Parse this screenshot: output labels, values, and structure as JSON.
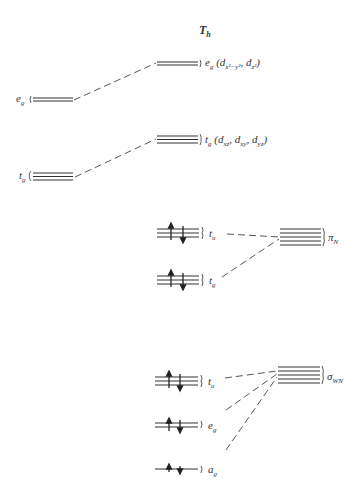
{
  "title": {
    "main": "T",
    "sub": "h"
  },
  "left_levels": [
    {
      "symbol": "e",
      "sub": "g",
      "lines": 2
    },
    {
      "symbol": "t",
      "sub": "g",
      "lines": 3
    }
  ],
  "right_d_levels": [
    {
      "symbol": "e",
      "sub": "g",
      "orbitals": "(d",
      "o1": "x²−y²",
      "o2": "z²",
      "lines": 2
    },
    {
      "symbol": "t",
      "sub": "g",
      "orbitals": "(d",
      "o1": "xz",
      "o2": "xy",
      "o3": "yz",
      "lines": 3
    }
  ],
  "ligand_levels": [
    {
      "symbol": "t",
      "sub": "u",
      "lines": 3,
      "electrons": 6
    },
    {
      "symbol": "t",
      "sub": "g",
      "lines": 3,
      "electrons": 6
    },
    {
      "symbol": "t",
      "sub": "u",
      "lines": 3,
      "electrons": 6
    },
    {
      "symbol": "e",
      "sub": "g",
      "lines": 2,
      "electrons": 4
    },
    {
      "symbol": "a",
      "sub": "g",
      "lines": 1,
      "electrons": 2
    }
  ],
  "groups": [
    {
      "symbol": "π",
      "sub": "N",
      "lines": 4
    },
    {
      "symbol": "σ",
      "sub": "WN",
      "lines": 4
    }
  ]
}
